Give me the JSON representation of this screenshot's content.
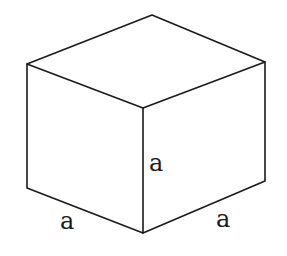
{
  "diagram": {
    "type": "cube",
    "labels": {
      "vertical_edge": "a",
      "bottom_left_edge": "a",
      "bottom_right_edge": "a"
    }
  }
}
